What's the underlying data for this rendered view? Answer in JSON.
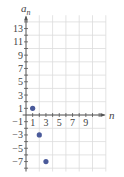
{
  "chart_data": {
    "type": "scatter",
    "title": "",
    "xlabel": "n",
    "ylabel": "a_n",
    "xlim": [
      0,
      10
    ],
    "ylim": [
      -8,
      14
    ],
    "grid": true,
    "x_tick_labels": [
      "1",
      "3",
      "5",
      "7",
      "9"
    ],
    "y_tick_labels": [
      "13",
      "11",
      "9",
      "7",
      "5",
      "3",
      "1",
      "-1",
      "-3",
      "-5",
      "-7"
    ],
    "series": [
      {
        "name": "a_n",
        "color": "#4a5a9a",
        "points": [
          [
            1,
            1
          ],
          [
            2,
            -3
          ],
          [
            3,
            -7
          ]
        ]
      }
    ]
  },
  "axes": {
    "x_label": "n",
    "y_label_base": "a",
    "y_label_sub": "n"
  },
  "colors": {
    "axis": "#555555",
    "grid": "#dcdcdc",
    "point": "#4a5a9a"
  }
}
